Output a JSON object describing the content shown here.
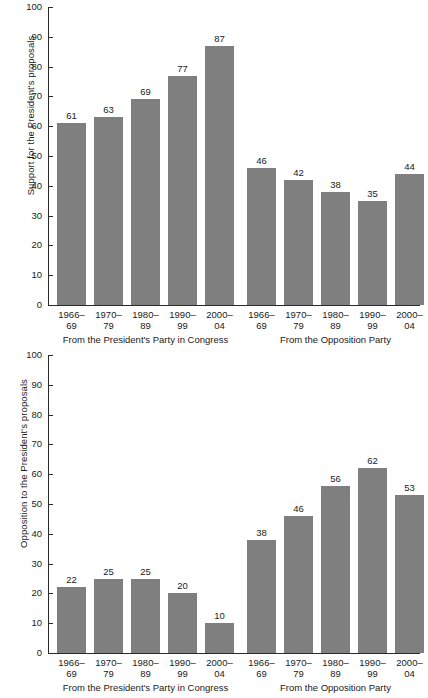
{
  "chart_data": [
    {
      "type": "bar",
      "title": "",
      "id": "support",
      "xlabel": "",
      "ylabel": "Support for the President's proposals",
      "ylim": [
        0,
        100
      ],
      "ytick_labels": [
        "0",
        "10",
        "20",
        "30",
        "40",
        "50",
        "60",
        "70",
        "80",
        "90",
        "100"
      ],
      "yticks": [
        0,
        10,
        20,
        30,
        40,
        50,
        60,
        70,
        80,
        90,
        100
      ],
      "grid": false,
      "legend": "none",
      "bar_color": "#7f7f7f",
      "groups": [
        {
          "label": "From the President's Party in Congress",
          "categories": [
            "1966–\n69",
            "1970–\n79",
            "1980–\n89",
            "1990–\n99",
            "2000–\n04"
          ],
          "category_lines": [
            [
              "1966–",
              "69"
            ],
            [
              "1970–",
              "79"
            ],
            [
              "1980–",
              "89"
            ],
            [
              "1990–",
              "99"
            ],
            [
              "2000–",
              "04"
            ]
          ],
          "values": [
            61,
            63,
            69,
            77,
            87
          ]
        },
        {
          "label": "From the Opposition Party",
          "categories": [
            "1966–\n69",
            "1970–\n79",
            "1980–\n89",
            "1990–\n99",
            "2000–\n04"
          ],
          "category_lines": [
            [
              "1966–",
              "69"
            ],
            [
              "1970–",
              "79"
            ],
            [
              "1980–",
              "89"
            ],
            [
              "1990–",
              "99"
            ],
            [
              "2000–",
              "04"
            ]
          ],
          "values": [
            46,
            42,
            38,
            35,
            44
          ]
        }
      ]
    },
    {
      "type": "bar",
      "title": "",
      "id": "opposition",
      "xlabel": "",
      "ylabel": "Opposition to the President's proposals",
      "ylim": [
        0,
        100
      ],
      "ytick_labels": [
        "0",
        "10",
        "20",
        "30",
        "40",
        "50",
        "60",
        "70",
        "80",
        "90",
        "100"
      ],
      "yticks": [
        0,
        10,
        20,
        30,
        40,
        50,
        60,
        70,
        80,
        90,
        100
      ],
      "grid": false,
      "legend": "none",
      "bar_color": "#7f7f7f",
      "groups": [
        {
          "label": "From the President's Party in Congress",
          "categories": [
            "1966–\n69",
            "1970–\n79",
            "1980–\n89",
            "1990–\n99",
            "2000–\n04"
          ],
          "category_lines": [
            [
              "1966–",
              "69"
            ],
            [
              "1970–",
              "79"
            ],
            [
              "1980–",
              "89"
            ],
            [
              "1990–",
              "99"
            ],
            [
              "2000–",
              "04"
            ]
          ],
          "values": [
            22,
            25,
            25,
            20,
            10
          ]
        },
        {
          "label": "From the Opposition Party",
          "categories": [
            "1966–\n69",
            "1970–\n79",
            "1980–\n89",
            "1990–\n99",
            "2000–\n04"
          ],
          "category_lines": [
            [
              "1966–",
              "69"
            ],
            [
              "1970–",
              "79"
            ],
            [
              "1980–",
              "89"
            ],
            [
              "1990–",
              "99"
            ],
            [
              "2000–",
              "04"
            ]
          ],
          "values": [
            38,
            46,
            56,
            62,
            53
          ]
        }
      ]
    }
  ]
}
